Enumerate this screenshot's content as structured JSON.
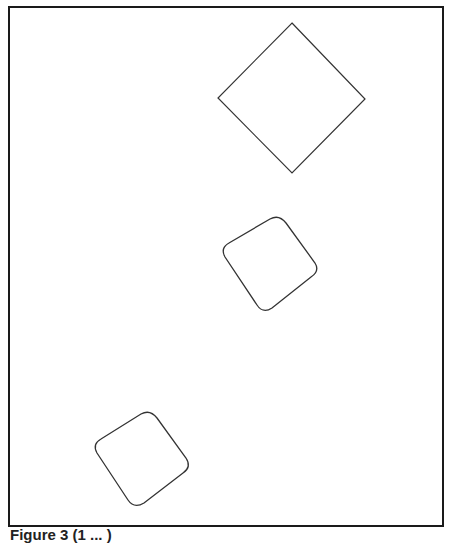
{
  "figure": {
    "caption": "Figure 3 (1 ... )",
    "stroke_color": "#333333",
    "frame_color": "#1a1a1a",
    "shapes": [
      {
        "name": "diamond",
        "type": "square-rotated-45",
        "points": [
          [
            292,
            23
          ],
          [
            365,
            99
          ],
          [
            292,
            173
          ],
          [
            218,
            98
          ]
        ],
        "corner_radius": 0
      },
      {
        "name": "rounded-square-middle",
        "type": "rounded-square-rotated",
        "points": [
          [
            279,
            215
          ],
          [
            318,
            272
          ],
          [
            262,
            313
          ],
          [
            221,
            247
          ]
        ],
        "corner_radius": 12
      },
      {
        "name": "rounded-square-bottom",
        "type": "rounded-square-rotated",
        "points": [
          [
            150,
            410
          ],
          [
            190,
            468
          ],
          [
            132,
            508
          ],
          [
            93,
            445
          ]
        ],
        "corner_radius": 12
      }
    ]
  }
}
